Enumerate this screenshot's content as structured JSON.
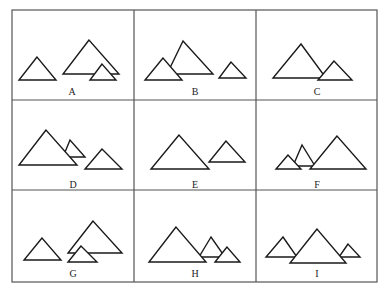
{
  "figure": {
    "grid": {
      "x": [
        12,
        134,
        256,
        377
      ],
      "y": [
        10,
        100,
        190,
        282
      ]
    },
    "cells": [
      {
        "label": "A",
        "label_pos": [
          72,
          95
        ],
        "triangles": [
          {
            "role": "small-left",
            "points": [
              [
                37,
                57
              ],
              [
                19,
                80
              ],
              [
                56,
                80
              ]
            ]
          },
          {
            "role": "large",
            "points": [
              [
                89,
                40
              ],
              [
                63,
                74
              ],
              [
                119,
                74
              ]
            ]
          },
          {
            "role": "small-front",
            "points": [
              [
                102,
                64
              ],
              [
                90,
                80
              ],
              [
                116,
                80
              ]
            ]
          }
        ]
      },
      {
        "label": "B",
        "label_pos": [
          195,
          95
        ],
        "triangles": [
          {
            "role": "large",
            "points": [
              [
                183,
                41
              ],
              [
                167,
                74
              ],
              [
                213,
                74
              ]
            ]
          },
          {
            "role": "small-left",
            "points": [
              [
                163,
                58
              ],
              [
                145,
                80
              ],
              [
                182,
                80
              ]
            ]
          },
          {
            "role": "small-right",
            "points": [
              [
                231,
                62
              ],
              [
                219,
                78
              ],
              [
                246,
                78
              ]
            ]
          }
        ]
      },
      {
        "label": "C",
        "label_pos": [
          317,
          95
        ],
        "triangles": [
          {
            "role": "large",
            "points": [
              [
                301,
                44
              ],
              [
                273,
                78
              ],
              [
                326,
                78
              ]
            ]
          },
          {
            "role": "small-right",
            "points": [
              [
                334,
                61
              ],
              [
                318,
                80
              ],
              [
                352,
                80
              ]
            ]
          }
        ]
      },
      {
        "label": "D",
        "label_pos": [
          73,
          188
        ],
        "triangles": [
          {
            "role": "small-middle",
            "points": [
              [
                70,
                140
              ],
              [
                63,
                157
              ],
              [
                85,
                157
              ]
            ]
          },
          {
            "role": "large",
            "points": [
              [
                46,
                130
              ],
              [
                19,
                165
              ],
              [
                77,
                165
              ]
            ]
          },
          {
            "role": "small-right",
            "points": [
              [
                102,
                149
              ],
              [
                85,
                169
              ],
              [
                122,
                169
              ]
            ]
          }
        ]
      },
      {
        "label": "E",
        "label_pos": [
          195,
          188
        ],
        "triangles": [
          {
            "role": "large",
            "points": [
              [
                179,
                135
              ],
              [
                151,
                169
              ],
              [
                209,
                169
              ]
            ]
          },
          {
            "role": "small-right",
            "points": [
              [
                226,
                141
              ],
              [
                209,
                162
              ],
              [
                245,
                162
              ]
            ]
          }
        ]
      },
      {
        "label": "F",
        "label_pos": [
          317,
          188
        ],
        "triangles": [
          {
            "role": "small-middle",
            "points": [
              [
                302,
                145
              ],
              [
                293,
                166
              ],
              [
                315,
                166
              ]
            ]
          },
          {
            "role": "small-left",
            "points": [
              [
                288,
                155
              ],
              [
                276,
                169
              ],
              [
                301,
                169
              ]
            ]
          },
          {
            "role": "large",
            "points": [
              [
                337,
                136
              ],
              [
                310,
                169
              ],
              [
                366,
                169
              ]
            ]
          }
        ]
      },
      {
        "label": "G",
        "label_pos": [
          73,
          277
        ],
        "triangles": [
          {
            "role": "small-left",
            "points": [
              [
                42,
                238
              ],
              [
                24,
                260
              ],
              [
                61,
                260
              ]
            ]
          },
          {
            "role": "large",
            "points": [
              [
                93,
                221
              ],
              [
                68,
                253
              ],
              [
                122,
                253
              ]
            ]
          },
          {
            "role": "small-front",
            "points": [
              [
                81,
                246
              ],
              [
                68,
                262
              ],
              [
                97,
                262
              ]
            ]
          }
        ]
      },
      {
        "label": "H",
        "label_pos": [
          195,
          277
        ],
        "triangles": [
          {
            "role": "small-middle",
            "points": [
              [
                211,
                237
              ],
              [
                199,
                257
              ],
              [
                225,
                257
              ]
            ]
          },
          {
            "role": "large",
            "points": [
              [
                176,
                227
              ],
              [
                149,
                262
              ],
              [
                206,
                262
              ]
            ]
          },
          {
            "role": "small-right",
            "points": [
              [
                227,
                247
              ],
              [
                215,
                262
              ],
              [
                240,
                262
              ]
            ]
          }
        ]
      },
      {
        "label": "I",
        "label_pos": [
          317,
          277
        ],
        "triangles": [
          {
            "role": "small-left",
            "points": [
              [
                283,
                237
              ],
              [
                266,
                257
              ],
              [
                297,
                257
              ]
            ]
          },
          {
            "role": "small-right",
            "points": [
              [
                348,
                244
              ],
              [
                339,
                257
              ],
              [
                360,
                257
              ]
            ]
          },
          {
            "role": "large",
            "points": [
              [
                317,
                229
              ],
              [
                290,
                263
              ],
              [
                346,
                263
              ]
            ]
          }
        ]
      }
    ]
  }
}
